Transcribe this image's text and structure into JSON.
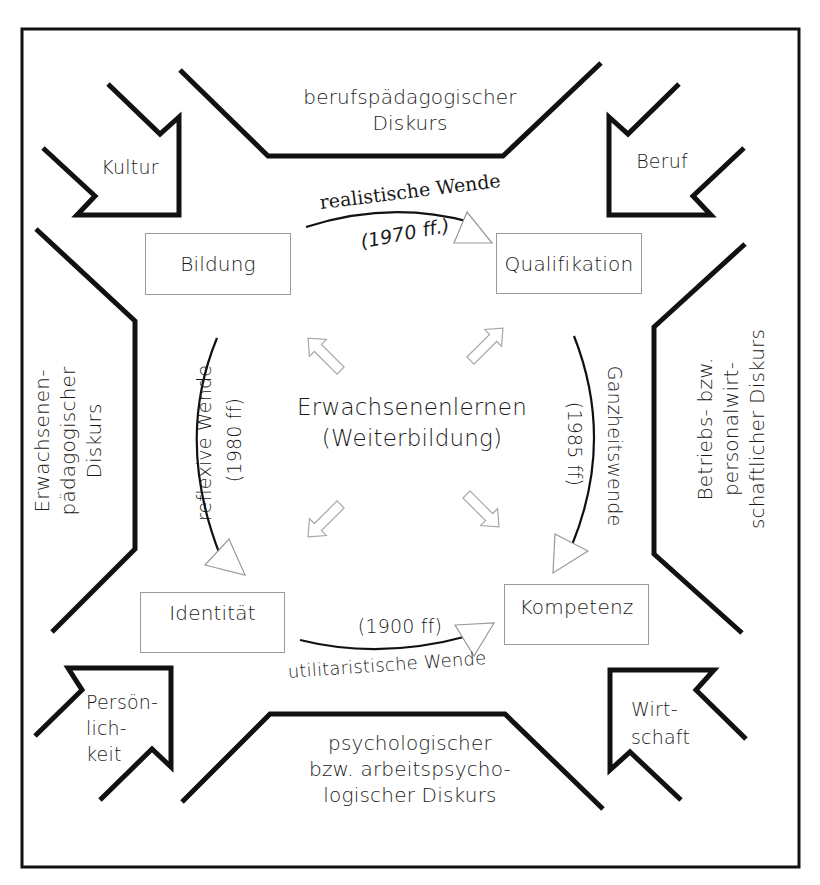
{
  "diagram": {
    "type": "concept-diagram",
    "center": {
      "line1": "Erwachsenenlernen",
      "line2": "(Weiterbildung)"
    },
    "concept_boxes": {
      "top_left": "Bildung",
      "top_right": "Qualifikation",
      "bottom_left": "Identität",
      "bottom_right": "Kompetenz"
    },
    "turns": {
      "top": {
        "name": "realistische Wende",
        "period": "(1970 ff.)",
        "from": "Bildung",
        "to": "Qualifikation"
      },
      "right": {
        "name": "Ganzheitswende",
        "period": "(1985 ff)",
        "from": "Qualifikation",
        "to": "Kompetenz"
      },
      "bottom": {
        "name": "utilitaristische Wende",
        "period": "(1900 ff)",
        "from": "Identität",
        "to": "Kompetenz"
      },
      "left": {
        "name": "reflexive Wende",
        "period": "(1980 ff)",
        "from": "Bildung",
        "to": "Identität"
      }
    },
    "discourses": {
      "top": {
        "line1": "berufspädagogischer",
        "line2": "Diskurs"
      },
      "left": {
        "line1": "Erwachsenen-",
        "line2": "pädagogischer",
        "line3": "Diskurs"
      },
      "right": {
        "line1": "Betriebs- bzw.",
        "line2": "personalwirt-",
        "line3": "schaftlicher Diskurs"
      },
      "bottom": {
        "line1": "psychologischer",
        "line2": "bzw. arbeitspsycho-",
        "line3": "logischer Diskurs"
      }
    },
    "corner_influences": {
      "top_left": {
        "line1": "Kultur"
      },
      "top_right": {
        "line1": "Beruf"
      },
      "bottom_left": {
        "line1": "Persön-",
        "line2": "lich-",
        "line3": "keit"
      },
      "bottom_right": {
        "line1": "Wirt-",
        "line2": "schaft"
      }
    },
    "colors": {
      "frame": "#111111",
      "box_border": "#9a9a9a",
      "hollow_arrow": "#a8a8a8",
      "text": "#1a1a1a"
    }
  }
}
